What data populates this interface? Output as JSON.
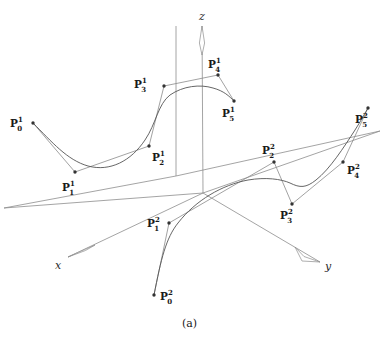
{
  "figure": {
    "caption": "(a)",
    "width": 383,
    "height": 337,
    "background_color": "#ffffff",
    "curve_color": "#555555",
    "polygon_color": "#8a8a8a",
    "axis_color": "#8d8d8d",
    "point_color": "#333333"
  },
  "axes": {
    "origin": {
      "x": 203,
      "y": 193
    },
    "items": [
      {
        "name": "z",
        "label": "z",
        "label_x": 199,
        "label_y": 11,
        "tip_x": 202,
        "tip_y": 26,
        "tail_x": 203,
        "tail_y": 193
      },
      {
        "name": "x",
        "label": "x",
        "label_x": 55,
        "label_y": 260,
        "tip_x": 68,
        "tip_y": 257,
        "tail_x": 203,
        "tail_y": 193
      },
      {
        "name": "y",
        "label": "y",
        "label_x": 325,
        "label_y": 261,
        "tip_x": 320,
        "tip_y": 262,
        "tail_x": 203,
        "tail_y": 193
      }
    ]
  },
  "curves": [
    {
      "id": "curve-1",
      "superscript": "1",
      "control_points": [
        {
          "index": "0",
          "x": 33,
          "y": 123,
          "label_x": 10,
          "label_y": 116
        },
        {
          "index": "1",
          "x": 75,
          "y": 172,
          "label_x": 62,
          "label_y": 180
        },
        {
          "index": "2",
          "x": 149,
          "y": 146,
          "label_x": 152,
          "label_y": 150
        },
        {
          "index": "3",
          "x": 164,
          "y": 86,
          "label_x": 134,
          "label_y": 77
        },
        {
          "index": "4",
          "x": 218,
          "y": 75,
          "label_x": 208,
          "label_y": 57
        },
        {
          "index": "5",
          "x": 234,
          "y": 101,
          "label_x": 222,
          "label_y": 106
        }
      ],
      "spline_path": "M 33 123 C 52 142, 67 160, 88 166 C 110 172, 131 161, 145 140 C 156 124, 158 104, 170 95 C 183 86, 200 84, 213 88 C 224 91, 229 96, 234 101"
    },
    {
      "id": "curve-2",
      "superscript": "2",
      "control_points": [
        {
          "index": "0",
          "x": 154,
          "y": 295,
          "label_x": 160,
          "label_y": 289
        },
        {
          "index": "1",
          "x": 169,
          "y": 223,
          "label_x": 147,
          "label_y": 216
        },
        {
          "index": "2",
          "x": 274,
          "y": 162,
          "label_x": 262,
          "label_y": 143
        },
        {
          "index": "3",
          "x": 292,
          "y": 204,
          "label_x": 280,
          "label_y": 208
        },
        {
          "index": "4",
          "x": 343,
          "y": 162,
          "label_x": 347,
          "label_y": 163
        },
        {
          "index": "5",
          "x": 368,
          "y": 108,
          "label_x": 355,
          "label_y": 112
        }
      ],
      "spline_path": "M 154 295 C 161 259, 166 238, 178 223 C 196 200, 222 185, 248 180 C 266 177, 281 179, 290 183 C 300 188, 306 188, 316 180 C 330 169, 344 147, 355 130 C 362 119, 365 113, 368 108"
    }
  ]
}
